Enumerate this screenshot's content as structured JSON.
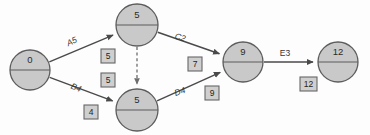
{
  "diagram": {
    "type": "network-diagram",
    "colors": {
      "node_fill": "#c9c9c9",
      "node_stroke": "#5c5c5c",
      "edge_stroke": "#4a4a4a",
      "dummy_edge_stroke": "#6d6d6d",
      "box_fill": "#cfcfcf",
      "box_stroke": "#676767",
      "text": "#232323",
      "background": "#fdfdfd"
    },
    "nodes": [
      {
        "id": "start",
        "label": "0",
        "cx": 30,
        "cy": 70,
        "r": 20
      },
      {
        "id": "top-middle",
        "label": "5",
        "cx": 137,
        "cy": 25,
        "r": 21
      },
      {
        "id": "bottom-middle",
        "label": "5",
        "cx": 137,
        "cy": 110,
        "r": 21
      },
      {
        "id": "join",
        "label": "9",
        "cx": 243,
        "cy": 62,
        "r": 20
      },
      {
        "id": "end",
        "label": "12",
        "cx": 338,
        "cy": 62,
        "r": 20
      }
    ],
    "edges": [
      {
        "id": "a",
        "label": "A5",
        "from": "start",
        "to": "top-middle",
        "style": "solid",
        "label_x": 72,
        "label_y": 42,
        "label_rotation": -24
      },
      {
        "id": "b",
        "label": "B4",
        "from": "start",
        "to": "bottom-middle",
        "style": "solid",
        "label_x": 76,
        "label_y": 88,
        "label_rotation": 22
      },
      {
        "id": "c",
        "label": "C2",
        "from": "top-middle",
        "to": "join",
        "style": "solid",
        "label_x": 180,
        "label_y": 38,
        "label_rotation": 17
      },
      {
        "id": "d",
        "label": "D4",
        "from": "bottom-middle",
        "to": "join",
        "style": "solid",
        "label_x": 180,
        "label_y": 92,
        "label_rotation": -19
      },
      {
        "id": "e",
        "label": "E3",
        "from": "join",
        "to": "end",
        "style": "solid",
        "label_x": 285,
        "label_y": 54,
        "label_rotation": 0
      },
      {
        "id": "dummy",
        "label": "",
        "from": "top-middle",
        "to": "bottom-middle",
        "style": "dashed",
        "label_x": 0,
        "label_y": 0,
        "label_rotation": 0
      }
    ],
    "duration_boxes": [
      {
        "id": "box-a",
        "value": "5",
        "x": 101,
        "y": 49
      },
      {
        "id": "box-dummy",
        "value": "5",
        "x": 101,
        "y": 73
      },
      {
        "id": "box-b",
        "value": "4",
        "x": 84,
        "y": 105
      },
      {
        "id": "box-c",
        "value": "7",
        "x": 188,
        "y": 57
      },
      {
        "id": "box-d",
        "value": "9",
        "x": 205,
        "y": 86
      },
      {
        "id": "box-e",
        "value": "12",
        "x": 300,
        "y": 77
      }
    ]
  }
}
